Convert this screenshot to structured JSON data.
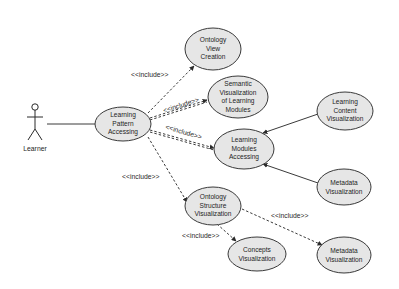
{
  "actor": {
    "label": "Learner"
  },
  "use_cases": {
    "lpa": {
      "lines": [
        "Learning",
        "Pattern",
        "Accessing"
      ]
    },
    "ovc": {
      "lines": [
        "Ontology",
        "View",
        "Creation"
      ]
    },
    "svlm": {
      "lines": [
        "Semantic",
        "Visualization",
        "of Learning",
        "Modules"
      ]
    },
    "lma": {
      "lines": [
        "Learning",
        "Modules",
        "Accessing"
      ]
    },
    "lcv": {
      "lines": [
        "Learning",
        "Content",
        "Visualization"
      ]
    },
    "mv1": {
      "lines": [
        "Metadata",
        "Visualization"
      ]
    },
    "osv": {
      "lines": [
        "Ontology",
        "Structure",
        "Visualization"
      ]
    },
    "cv": {
      "lines": [
        "Concepts",
        "Visualization"
      ]
    },
    "mv2": {
      "lines": [
        "Metadata",
        "Visualization"
      ]
    }
  },
  "relations": {
    "include_label": "<<include>>",
    "lpa_ovc": "<<include>>",
    "lpa_svlm": "<<include>>",
    "lpa_lma": "<<include>>",
    "lpa_osv": "<<include>>",
    "osv_cv": "<<include>>",
    "osv_mv2": "<<include>>"
  }
}
